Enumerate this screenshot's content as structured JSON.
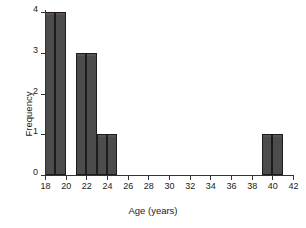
{
  "chart_data": {
    "type": "bar",
    "title": "",
    "xlabel": "Age (years)",
    "ylabel": "Frequency",
    "xlim": [
      18,
      42
    ],
    "ylim": [
      0,
      4
    ],
    "grid": false,
    "legend": null,
    "bin_width": 1,
    "xticks": [
      18,
      20,
      22,
      24,
      26,
      28,
      30,
      32,
      34,
      36,
      38,
      40,
      42
    ],
    "xtick_labels": [
      "18",
      "20",
      "22",
      "24",
      "26",
      "28",
      "30",
      "32",
      "34",
      "36",
      "38",
      "40",
      "42"
    ],
    "yticks": [
      0,
      1,
      2,
      3,
      4
    ],
    "ytick_labels": [
      "0",
      "1",
      "2",
      "3",
      "4"
    ],
    "bars": [
      {
        "bin_start": 18,
        "bin_end": 19,
        "value": 4
      },
      {
        "bin_start": 19,
        "bin_end": 20,
        "value": 4
      },
      {
        "bin_start": 21,
        "bin_end": 22,
        "value": 3
      },
      {
        "bin_start": 22,
        "bin_end": 23,
        "value": 3
      },
      {
        "bin_start": 23,
        "bin_end": 24,
        "value": 1
      },
      {
        "bin_start": 24,
        "bin_end": 25,
        "value": 1
      },
      {
        "bin_start": 39,
        "bin_end": 40,
        "value": 1
      },
      {
        "bin_start": 40,
        "bin_end": 41,
        "value": 1
      }
    ],
    "categories": [
      "18-19",
      "19-20",
      "21-22",
      "22-23",
      "23-24",
      "24-25",
      "39-40",
      "40-41"
    ],
    "values": [
      4,
      4,
      3,
      3,
      1,
      1,
      1,
      1
    ],
    "colors": {
      "bar_fill": "#4c4c4c",
      "bar_edge": "#1c1c1c",
      "axis": "#333333",
      "text": "#1a1a1a",
      "background": "#ffffff"
    }
  }
}
